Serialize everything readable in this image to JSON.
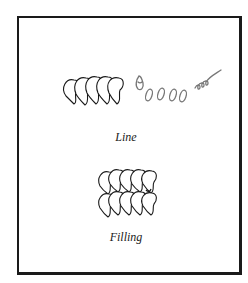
{
  "figure": {
    "sections": [
      {
        "caption": "Line",
        "description": "Row of overlapping scalloped stitches followed by progressive oval stitch steps and a looped line"
      },
      {
        "caption": "Filling",
        "description": "Two rows of overlapping scalloped stitches forming a filled block"
      }
    ],
    "colors": {
      "ink": "#1a1a1a",
      "pencil": "#777777",
      "background": "#ffffff"
    }
  }
}
